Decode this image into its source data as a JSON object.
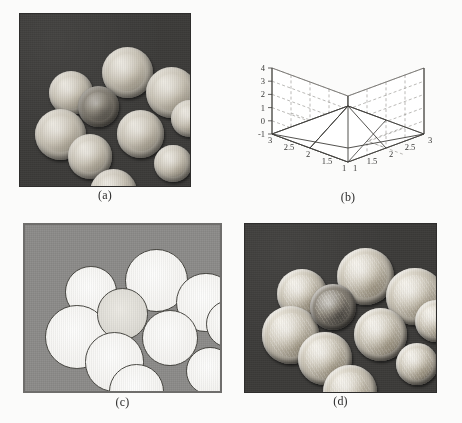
{
  "figure": {
    "panels": [
      {
        "id": "a",
        "caption": "(a)",
        "kind": "photograph",
        "description": "Original grayscale image of ten coins on a dark background",
        "background_color": "#3c3b39",
        "coin_count": 10
      },
      {
        "id": "b",
        "caption": "(b)",
        "kind": "surface-plot",
        "description": "3D mesh surface plot of the filter kernel"
      },
      {
        "id": "c",
        "caption": "(c)",
        "kind": "photograph",
        "description": "Segmented binary result: coins appear as white blobs on a uniform gray background",
        "background_color": "#8b8a88",
        "coin_count": 10
      },
      {
        "id": "d",
        "caption": "(d)",
        "kind": "photograph",
        "description": "Sharpened/enhanced version of the original coin image",
        "background_color": "#3c3b39",
        "coin_count": 10
      }
    ]
  },
  "chart_data": {
    "type": "surface",
    "title": "",
    "xlabel": "",
    "ylabel": "",
    "zlabel": "",
    "grid": true,
    "legend": false,
    "x_ticks": [
      "3",
      "2.5",
      "2",
      "1.5",
      "1"
    ],
    "y_ticks": [
      "1",
      "1.5",
      "2",
      "2.5",
      "3"
    ],
    "z_ticks": [
      "4",
      "3",
      "2",
      "1",
      "0",
      "-1"
    ],
    "xlim": [
      1,
      3
    ],
    "ylim": [
      1,
      3
    ],
    "zlim": [
      -1,
      4
    ],
    "x": [
      1,
      2,
      3
    ],
    "y": [
      1,
      2,
      3
    ],
    "z": [
      [
        -1,
        -1,
        -1
      ],
      [
        -1,
        2.7,
        -1
      ],
      [
        -1,
        -1,
        -1
      ]
    ],
    "peak_value": 2.7,
    "base_value": -1
  },
  "panel_a_coins": [
    {
      "cx": 17,
      "cy": 33,
      "r": 13,
      "tone": "light"
    },
    {
      "cx": 48,
      "cy": 19,
      "r": 15,
      "tone": "light"
    },
    {
      "cx": 9,
      "cy": 55,
      "r": 15,
      "tone": "light"
    },
    {
      "cx": 34,
      "cy": 42,
      "r": 12,
      "tone": "dim"
    },
    {
      "cx": 74,
      "cy": 31,
      "r": 15,
      "tone": "light"
    },
    {
      "cx": 28,
      "cy": 70,
      "r": 13,
      "tone": "light"
    },
    {
      "cx": 57,
      "cy": 56,
      "r": 14,
      "tone": "light"
    },
    {
      "cx": 89,
      "cy": 50,
      "r": 11,
      "tone": "light"
    },
    {
      "cx": 79,
      "cy": 76,
      "r": 11,
      "tone": "light"
    },
    {
      "cx": 41,
      "cy": 90,
      "r": 14,
      "tone": "light"
    }
  ],
  "panel_c_blobs": [
    {
      "cx": 20,
      "cy": 24,
      "r": 13,
      "style": "plain"
    },
    {
      "cx": 50,
      "cy": 14,
      "r": 16,
      "style": "plain"
    },
    {
      "cx": 10,
      "cy": 47,
      "r": 16,
      "style": "plain"
    },
    {
      "cx": 36,
      "cy": 37,
      "r": 13,
      "style": "textured"
    },
    {
      "cx": 76,
      "cy": 28,
      "r": 15,
      "style": "plain"
    },
    {
      "cx": 30,
      "cy": 63,
      "r": 15,
      "style": "plain"
    },
    {
      "cx": 59,
      "cy": 50,
      "r": 14,
      "style": "plain"
    },
    {
      "cx": 91,
      "cy": 44,
      "r": 12,
      "style": "plain"
    },
    {
      "cx": 81,
      "cy": 72,
      "r": 12,
      "style": "plain"
    },
    {
      "cx": 42,
      "cy": 82,
      "r": 14,
      "style": "plain"
    }
  ],
  "panel_d_coins": [
    {
      "cx": 17,
      "cy": 27,
      "r": 13,
      "tone": "light"
    },
    {
      "cx": 48,
      "cy": 14,
      "r": 15,
      "tone": "light"
    },
    {
      "cx": 9,
      "cy": 49,
      "r": 15,
      "tone": "light"
    },
    {
      "cx": 34,
      "cy": 36,
      "r": 12,
      "tone": "dim"
    },
    {
      "cx": 74,
      "cy": 26,
      "r": 15,
      "tone": "light"
    },
    {
      "cx": 28,
      "cy": 64,
      "r": 14,
      "tone": "light"
    },
    {
      "cx": 57,
      "cy": 50,
      "r": 14,
      "tone": "light"
    },
    {
      "cx": 89,
      "cy": 45,
      "r": 11,
      "tone": "light"
    },
    {
      "cx": 79,
      "cy": 71,
      "r": 11,
      "tone": "light"
    },
    {
      "cx": 41,
      "cy": 84,
      "r": 14,
      "tone": "light"
    }
  ]
}
